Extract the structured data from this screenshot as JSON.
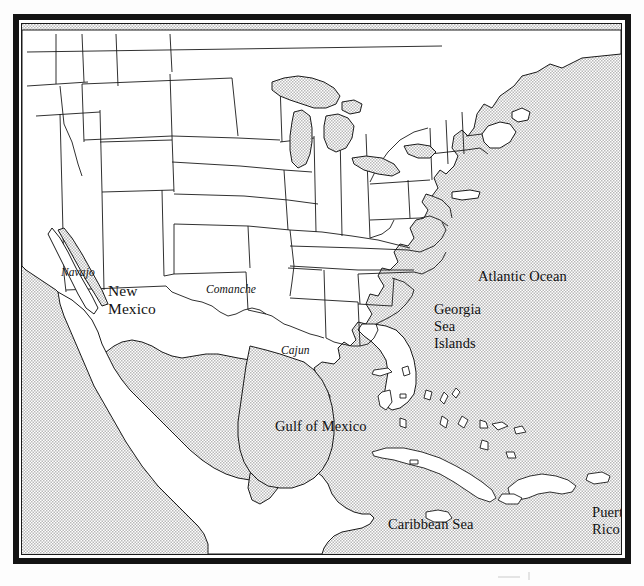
{
  "document": {
    "kind": "scanned-map-figure",
    "title": "North America — Gulf, Caribbean and Atlantic regions"
  },
  "map": {
    "projection_note": "continental United States, Mexico, Central America and the Caribbean",
    "ocean_fill": "#e9e9e9",
    "land_fill": "#ffffff",
    "outline_color": "#1a1a1a",
    "frame_color": "#141414"
  },
  "labels": {
    "water": [
      {
        "id": "atlantic-ocean",
        "text": "Atlantic Ocean",
        "x": 456,
        "y": 244
      },
      {
        "id": "gulf-of-mexico",
        "text": "Gulf of Mexico",
        "x": 253,
        "y": 394
      },
      {
        "id": "caribbean-sea",
        "text": "Caribbean Sea",
        "x": 366,
        "y": 492
      }
    ],
    "states": [
      {
        "id": "new-mexico",
        "lines": [
          "New",
          "Mexico"
        ],
        "x": 86,
        "y": 258
      }
    ],
    "regions": [
      {
        "id": "georgia-sea-islands",
        "lines": [
          "Georgia",
          "Sea",
          "Islands"
        ],
        "x": 412,
        "y": 277
      },
      {
        "id": "puerto-rico",
        "lines": [
          "Puerto",
          "Rico"
        ],
        "x": 570,
        "y": 480
      }
    ],
    "cultures": [
      {
        "id": "navajo",
        "text": "Navajo",
        "x": 39,
        "y": 242
      },
      {
        "id": "comanche",
        "text": "Comanche",
        "x": 184,
        "y": 259
      },
      {
        "id": "cajun",
        "text": "Cajun",
        "x": 259,
        "y": 320
      }
    ]
  }
}
